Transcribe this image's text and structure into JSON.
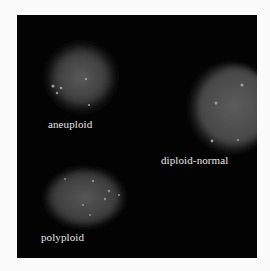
{
  "figure": {
    "background_color": "#030303",
    "label_color": "#e6e6e6",
    "cells": [
      {
        "id": "aneuploid",
        "label": "aneuploid"
      },
      {
        "id": "diploid-normal",
        "label": "diploid-normal"
      },
      {
        "id": "polyploid",
        "label": "polyploid"
      }
    ]
  }
}
